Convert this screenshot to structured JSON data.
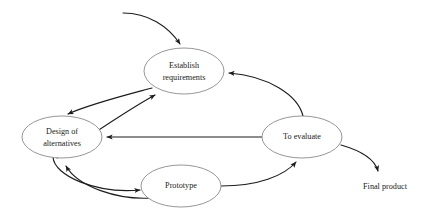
{
  "diagram": {
    "type": "cycle-diagram",
    "canvas": {
      "width": 423,
      "height": 220
    },
    "colors": {
      "background": "#ffffff",
      "node_stroke": "#8a8a8a",
      "node_fill": "#ffffff",
      "edge_stroke": "#1c1c1c",
      "text": "#1a1a1a"
    },
    "nodes": [
      {
        "id": "establish-requirements",
        "label_lines": [
          "Establish",
          "requirements"
        ],
        "line1": "Establish",
        "line2": "requirements",
        "cx": 184,
        "cy": 71,
        "rx": 40,
        "ry": 23
      },
      {
        "id": "design-of-alternatives",
        "label_lines": [
          "Design of",
          "alternatives"
        ],
        "line1": "Design of",
        "line2": "alternatives",
        "cx": 62,
        "cy": 137,
        "rx": 40,
        "ry": 21
      },
      {
        "id": "to-evaluate",
        "label_lines": [
          "To evaluate"
        ],
        "line1": "To evaluate",
        "line2": "",
        "cx": 302,
        "cy": 137,
        "rx": 40,
        "ry": 21
      },
      {
        "id": "prototype",
        "label_lines": [
          "Prototype"
        ],
        "line1": "Prototype",
        "line2": "",
        "cx": 181,
        "cy": 186,
        "rx": 40,
        "ry": 21
      }
    ],
    "terminals": [
      {
        "id": "final-product",
        "label": "Final product",
        "x": 385,
        "y": 187
      }
    ],
    "edges": [
      {
        "id": "entry-to-establish",
        "from": "",
        "to": "establish-requirements",
        "kind": "curved",
        "arrow": "end"
      },
      {
        "id": "establish-to-design",
        "from": "establish-requirements",
        "to": "design-of-alternatives",
        "kind": "curved",
        "arrow": "end"
      },
      {
        "id": "design-to-establish",
        "from": "design-of-alternatives",
        "to": "establish-requirements",
        "kind": "curved",
        "arrow": "end"
      },
      {
        "id": "design-to-prototype",
        "from": "design-of-alternatives",
        "to": "prototype",
        "kind": "curved",
        "arrow": "end"
      },
      {
        "id": "prototype-to-design",
        "from": "prototype",
        "to": "design-of-alternatives",
        "kind": "curved",
        "arrow": "end"
      },
      {
        "id": "prototype-to-evaluate",
        "from": "prototype",
        "to": "to-evaluate",
        "kind": "curved",
        "arrow": "end"
      },
      {
        "id": "evaluate-to-design",
        "from": "to-evaluate",
        "to": "design-of-alternatives",
        "kind": "straight",
        "arrow": "end"
      },
      {
        "id": "evaluate-to-establish",
        "from": "to-evaluate",
        "to": "establish-requirements",
        "kind": "curved",
        "arrow": "end"
      },
      {
        "id": "evaluate-to-final-product",
        "from": "to-evaluate",
        "to": "final-product",
        "kind": "curved",
        "arrow": "end"
      }
    ]
  }
}
